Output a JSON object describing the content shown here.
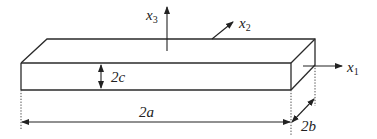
{
  "figure": {
    "colors": {
      "line": "#2a2a2a",
      "text": "#222222",
      "background": "#ffffff"
    }
  },
  "axes": {
    "x1": {
      "label": "x",
      "subscript": "1"
    },
    "x2": {
      "label": "x",
      "subscript": "2"
    },
    "x3": {
      "label": "x",
      "subscript": "3"
    }
  },
  "dimensions": {
    "length": {
      "label": "2a"
    },
    "width": {
      "label": "2b"
    },
    "thickness": {
      "label": "2c"
    }
  }
}
